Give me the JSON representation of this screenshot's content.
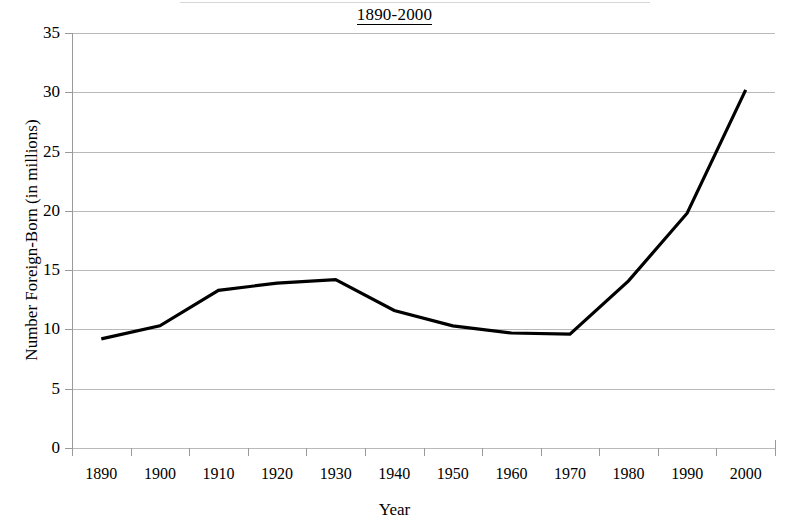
{
  "chart_data": {
    "type": "line",
    "title": "1890-2000",
    "xlabel": "Year",
    "ylabel": "Number Foreign-Born (in millions)",
    "categories": [
      "1890",
      "1900",
      "1910",
      "1920",
      "1930",
      "1940",
      "1950",
      "1960",
      "1970",
      "1980",
      "1990",
      "2000"
    ],
    "values": [
      9.2,
      10.3,
      13.3,
      13.9,
      14.2,
      11.6,
      10.3,
      9.7,
      9.6,
      14.1,
      19.8,
      30.2
    ],
    "series": [
      {
        "name": "Number Foreign-Born (in millions)",
        "values": [
          9.2,
          10.3,
          13.3,
          13.9,
          14.2,
          11.6,
          10.3,
          9.7,
          9.6,
          14.1,
          19.8,
          30.2
        ],
        "color": "#000000",
        "line_width": 3.2
      }
    ],
    "ylim": [
      0,
      35
    ],
    "ytick_labels": [
      "0",
      "5",
      "10",
      "15",
      "20",
      "25",
      "30",
      "35"
    ],
    "ytick_values": [
      0,
      5,
      10,
      15,
      20,
      25,
      30,
      35
    ],
    "grid": "horizontal",
    "grid_color": "#b9b9b9",
    "axis_color": "#9a9a9a",
    "legend": "none",
    "legend_position": "none",
    "background": "#ffffff"
  }
}
